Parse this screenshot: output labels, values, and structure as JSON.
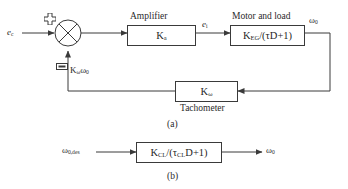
{
  "figure": {
    "caption_a": "(a)",
    "caption_b": "(b)"
  },
  "diagram_a": {
    "input_signal": "e",
    "input_signal_sub": "c",
    "summing_junction": {
      "name": "summing-junction",
      "plus_label": "+",
      "minus_label": "−"
    },
    "amplifier": {
      "title": "Amplifier",
      "gain": "K",
      "gain_sub": "a"
    },
    "mid_signal": "e",
    "mid_signal_sub": "i",
    "motor": {
      "title": "Motor and load",
      "transfer_num": "K",
      "transfer_num_sub": "EG",
      "transfer_den": "/(τD+1)"
    },
    "output_signal": "ω",
    "output_signal_sub": "0",
    "feedback_signal": "K",
    "feedback_signal_sub1": "ω",
    "feedback_signal_2": "ω",
    "feedback_signal_sub2": "0",
    "tachometer": {
      "gain": "K",
      "gain_sub": "ω",
      "title": "Tachometer"
    }
  },
  "diagram_b": {
    "input_signal": "ω",
    "input_signal_sub": "0,des",
    "closed_loop": {
      "transfer_num": "K",
      "transfer_num_sub": "CL",
      "transfer_mid": "/(τ",
      "transfer_mid_sub": "CL",
      "transfer_end": "D+1)"
    },
    "output_signal": "ω",
    "output_signal_sub": "0"
  },
  "colors": {
    "line": "#3a3a3a",
    "text": "#1f1f1f",
    "background": "#ffffff"
  }
}
